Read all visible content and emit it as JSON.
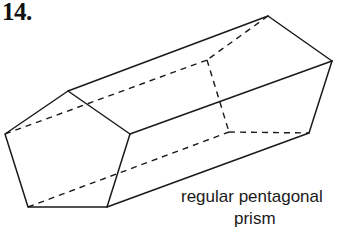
{
  "problem_number": "14.",
  "caption": {
    "line1": "regular pentagonal",
    "line2": "prism"
  },
  "figure": {
    "type": "regular pentagonal prism",
    "front_face": [
      [
        68,
        91
      ],
      [
        130,
        134
      ],
      [
        107,
        207
      ],
      [
        28,
        207
      ],
      [
        5,
        134
      ]
    ],
    "back_face": [
      [
        268,
        16
      ],
      [
        332,
        61
      ],
      [
        309,
        133
      ],
      [
        229,
        132
      ],
      [
        207,
        60
      ]
    ],
    "line_color": "#1a1a1a"
  }
}
